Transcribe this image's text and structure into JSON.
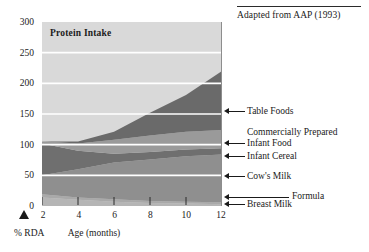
{
  "source": {
    "text": "Adapted from AAP (1993)"
  },
  "chart_data": {
    "type": "area",
    "stacked": true,
    "title": "Protein Intake",
    "xlabel": "Age (months)",
    "ylabel": "% RDA",
    "x": [
      2,
      4,
      6,
      8,
      10,
      12
    ],
    "xticks": [
      "2",
      "4",
      "6",
      "8",
      "10",
      "12"
    ],
    "xlim": [
      2,
      12
    ],
    "yticks": [
      "0",
      "50",
      "100",
      "150",
      "200",
      "250",
      "300"
    ],
    "ylim": [
      0,
      300
    ],
    "grid": true,
    "legend_position": "right-callouts",
    "series": [
      {
        "name": "Breast Milk",
        "color": "#b5b5b5",
        "values": [
          14,
          10,
          7,
          5,
          4,
          3
        ]
      },
      {
        "name": "Formula",
        "color": "#a9a9a9",
        "values": [
          5,
          4,
          4,
          3,
          3,
          3
        ]
      },
      {
        "name": "Cow's Milk",
        "color": "#8f8f8f",
        "values": [
          31,
          46,
          60,
          68,
          74,
          78
        ]
      },
      {
        "name": "Infant Cereal",
        "color": "#6f6f6f",
        "values": [
          52,
          30,
          14,
          12,
          11,
          10
        ]
      },
      {
        "name": "Commercially Prepared Infant Food",
        "color": "#9a9a9a",
        "values": [
          3,
          12,
          23,
          27,
          29,
          30
        ]
      },
      {
        "name": "Table Foods",
        "color": "#6a6a6a",
        "values": [
          0,
          3,
          13,
          37,
          60,
          96
        ]
      }
    ],
    "annotations": [
      {
        "label": "Table Foods"
      },
      {
        "label": "Commercially Prepared"
      },
      {
        "label": "Infant Food"
      },
      {
        "label": "Infant Cereal"
      },
      {
        "label": "Cow's Milk"
      },
      {
        "label": "Formula"
      },
      {
        "label": "Breast Milk"
      }
    ]
  },
  "axis": {
    "y_labels": [
      "300",
      "250",
      "200",
      "150",
      "100",
      "50",
      "0"
    ],
    "x_labels": [
      "2",
      "4",
      "6",
      "8",
      "10",
      "12"
    ],
    "x_title": "Age (months)",
    "y_title": "% RDA"
  },
  "callouts": {
    "table_foods": "Table Foods",
    "commercially_prepared": "Commercially Prepared",
    "infant_food": "Infant Food",
    "infant_cereal": "Infant Cereal",
    "cows_milk": "Cow's Milk",
    "formula": "Formula",
    "breast_milk": "Breast Milk"
  },
  "colors": {
    "plot_background": "#d9d9d9",
    "gridline": "#ffffff",
    "text": "#1a1a1a"
  }
}
